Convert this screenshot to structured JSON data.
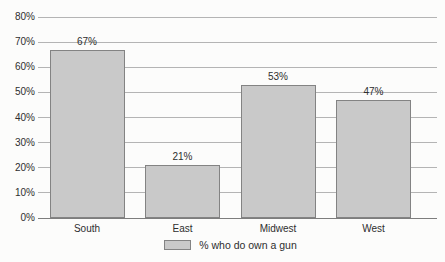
{
  "chart_data": {
    "type": "bar",
    "title": "",
    "xlabel": "",
    "ylabel": "",
    "categories": [
      "South",
      "East",
      "Midwest",
      "West"
    ],
    "values": [
      67,
      21,
      53,
      47
    ],
    "value_labels": [
      "67%",
      "21%",
      "53%",
      "47%"
    ],
    "ylim": [
      0,
      80
    ],
    "ytick_step": 10,
    "ytick_labels": [
      "0%",
      "10%",
      "20%",
      "30%",
      "40%",
      "50%",
      "60%",
      "70%",
      "80%"
    ],
    "grid": true,
    "legend": {
      "position": "bottom-center",
      "items": [
        {
          "label": "% who do own a gun",
          "swatch_color": "#c9c9c9"
        }
      ]
    },
    "colors": {
      "background": "#fcfcfb",
      "bar_fill": "#c9c9c9",
      "bar_border": "#838383",
      "gridline": "#b4b4b4",
      "axis_line": "#7d7d7d",
      "text": "#2e2e2e"
    }
  }
}
